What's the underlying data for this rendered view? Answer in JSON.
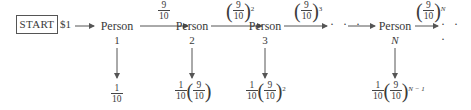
{
  "diagram": {
    "start_label": "START",
    "initial_amount": "$1",
    "nodes": [
      {
        "label": "Person",
        "index": "1",
        "amount_prefix": "1/10",
        "amount": "1/10"
      },
      {
        "label": "Person",
        "index": "2",
        "amount": "1/10 (9/10)"
      },
      {
        "label": "Person",
        "index": "3",
        "amount": "1/10 (9/10)^2"
      },
      {
        "label": "Person",
        "index": "N",
        "amount": "1/10 (9/10)^(N-1)"
      }
    ],
    "edges": [
      {
        "from": "Person 1",
        "to": "Person 2",
        "label": "9/10"
      },
      {
        "from": "Person 2",
        "to": "Person 3",
        "label": "(9/10)^2"
      },
      {
        "from": "Person 3",
        "to": "...",
        "label": "(9/10)^3"
      },
      {
        "from": "Person N",
        "to": "...",
        "label": "(9/10)^N"
      }
    ],
    "fraction": {
      "one": "1",
      "nine": "9",
      "ten": "10"
    },
    "exponents": {
      "two": "2",
      "three": "3",
      "n": "N",
      "n_minus_1": "N − 1"
    },
    "ellipsis": "· · ·",
    "line_color": "#555555"
  }
}
